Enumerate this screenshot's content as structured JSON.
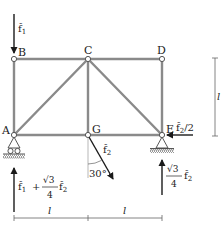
{
  "diagram": {
    "type": "truss",
    "colors": {
      "member": "#8a8a8a",
      "arrow": "#1a1a1a",
      "text": "#222222",
      "dim": "#666666"
    },
    "nodes": {
      "A": {
        "label": "A",
        "x": 14,
        "y": 135
      },
      "B": {
        "label": "B",
        "x": 14,
        "y": 59
      },
      "C": {
        "label": "C",
        "x": 88,
        "y": 59
      },
      "D": {
        "label": "D",
        "x": 162,
        "y": 59
      },
      "G": {
        "label": "G",
        "x": 88,
        "y": 135
      },
      "E": {
        "label": "E",
        "x": 162,
        "y": 135
      }
    },
    "members": [
      "A-B",
      "B-C",
      "C-D",
      "D-E",
      "A-G",
      "G-E",
      "C-G",
      "A-C",
      "C-E"
    ],
    "supports": [
      {
        "node": "A",
        "type": "roller"
      },
      {
        "node": "E",
        "type": "pin"
      }
    ],
    "loads": {
      "f1": {
        "node": "B",
        "label_main": "f̂",
        "label_sub": "1",
        "direction": "down"
      },
      "f2": {
        "node": "G",
        "label_main": "f̂",
        "label_sub": "2",
        "angle_label": "30°",
        "direction": "30° from vertical, down-right"
      },
      "f2_half": {
        "node": "E",
        "label_main": "f̂",
        "label_sub": "2",
        "label_suffix": "/2",
        "direction": "left"
      }
    },
    "reactions": {
      "A": {
        "term1_main": "f̂",
        "term1_sub": "1",
        "plus": "+",
        "frac_num": "√3",
        "frac_den": "4",
        "term2_main": "f̂",
        "term2_sub": "2",
        "direction": "up"
      },
      "E": {
        "frac_num": "√3",
        "frac_den": "4",
        "term_main": "f̂",
        "term_sub": "2",
        "direction": "up"
      }
    },
    "dimensions": {
      "bottom_left": "l",
      "bottom_right": "l",
      "right_height": "l"
    }
  }
}
